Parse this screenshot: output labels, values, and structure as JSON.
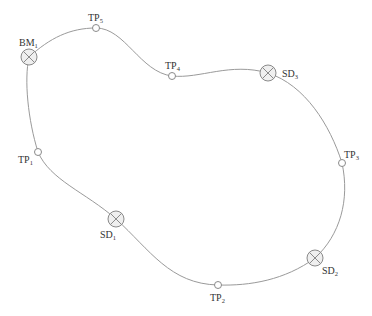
{
  "diagram": {
    "type": "closed leveling route",
    "route_order": [
      "BM1",
      "TP5",
      "TP4",
      "SD3",
      "TP3",
      "SD2",
      "TP2",
      "SD1",
      "TP1",
      "BM1"
    ],
    "colors": {
      "line": "#9a9a9a",
      "marker_stroke": "#8a8a8a",
      "station_fill": "#efefef",
      "text": "#333333"
    },
    "points": [
      {
        "id": "BM1",
        "kind": "benchmark",
        "label_main": "BM",
        "label_sub": "1"
      },
      {
        "id": "TP5",
        "kind": "turning-point",
        "label_main": "TP",
        "label_sub": "5"
      },
      {
        "id": "TP4",
        "kind": "turning-point",
        "label_main": "TP",
        "label_sub": "4"
      },
      {
        "id": "SD3",
        "kind": "station",
        "label_main": "SD",
        "label_sub": "3"
      },
      {
        "id": "TP3",
        "kind": "turning-point",
        "label_main": "TP",
        "label_sub": "3"
      },
      {
        "id": "SD2",
        "kind": "station",
        "label_main": "SD",
        "label_sub": "2"
      },
      {
        "id": "TP2",
        "kind": "turning-point",
        "label_main": "TP",
        "label_sub": "2"
      },
      {
        "id": "SD1",
        "kind": "station",
        "label_main": "SD",
        "label_sub": "1"
      },
      {
        "id": "TP1",
        "kind": "turning-point",
        "label_main": "TP",
        "label_sub": "1"
      }
    ]
  }
}
